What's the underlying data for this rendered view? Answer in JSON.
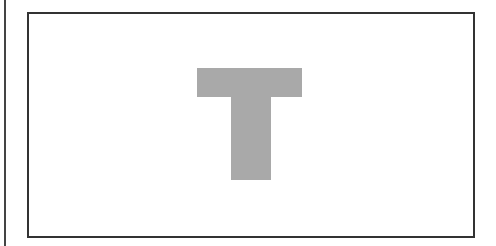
{
  "figure": {
    "shape": "letter-T",
    "fill_color": "#a9a9a9",
    "border_color": "#333333",
    "background": "#ffffff"
  }
}
